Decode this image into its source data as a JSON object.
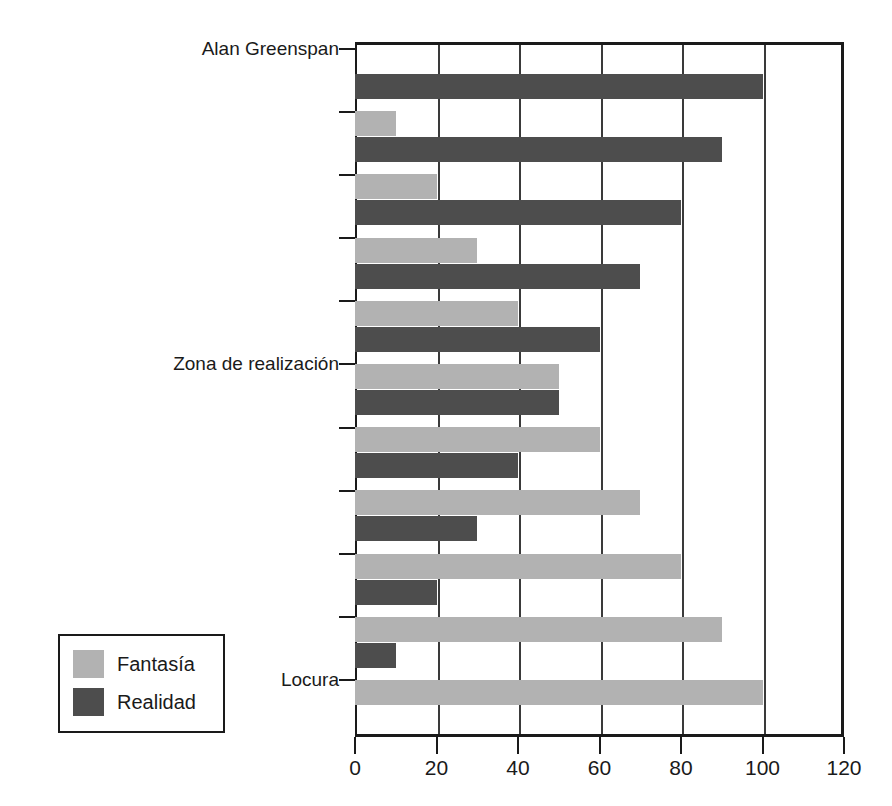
{
  "chart_data": {
    "type": "bar",
    "orientation": "horizontal",
    "title": "",
    "subtitle": "",
    "xlabel": "",
    "ylabel": "",
    "xlim": [
      0,
      120
    ],
    "xticks": [
      0,
      20,
      40,
      60,
      80,
      100,
      120
    ],
    "xtick_labels": [
      "0",
      "20",
      "40",
      "60",
      "80",
      "100",
      "120"
    ],
    "grid": "vertical",
    "legend_position": "outside-left-bottom",
    "categories": [
      "",
      "",
      "",
      "",
      "",
      "",
      "",
      "",
      "",
      "",
      ""
    ],
    "ytick_labels": [
      {
        "index": 0,
        "label": "Alan Greenspan"
      },
      {
        "index": 5,
        "label": "Zona de realización"
      },
      {
        "index": 10,
        "label": "Locura"
      }
    ],
    "series": [
      {
        "name": "Fantasía",
        "color": "#b2b2b2",
        "values": [
          0,
          10,
          20,
          30,
          40,
          50,
          60,
          70,
          80,
          90,
          100
        ]
      },
      {
        "name": "Realidad",
        "color": "#4d4d4d",
        "values": [
          100,
          90,
          80,
          70,
          60,
          50,
          40,
          30,
          20,
          10,
          0
        ]
      }
    ]
  },
  "legend": {
    "items": [
      {
        "label": "Fantasía",
        "color": "#b2b2b2"
      },
      {
        "label": "Realidad",
        "color": "#4d4d4d"
      }
    ]
  },
  "axis": {
    "x_tick_labels": [
      "0",
      "20",
      "40",
      "60",
      "80",
      "100",
      "120"
    ],
    "y_labels": [
      "Alan Greenspan",
      "Zona de realización",
      "Locura"
    ]
  },
  "colors": {
    "fantasia": "#b2b2b2",
    "realidad": "#4d4d4d",
    "frame": "#1a1a1a",
    "grid": "#3a3a3a",
    "background": "#ffffff"
  }
}
